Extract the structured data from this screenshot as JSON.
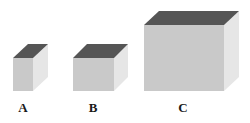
{
  "figure": {
    "colors": {
      "front": "#c9c9c9",
      "side": "#e6e6e6",
      "top": "#555555"
    },
    "cubes": [
      {
        "label": "A",
        "front": {
          "x": 13,
          "y": 58,
          "w": 20,
          "h": 33
        },
        "depth_dx": 15,
        "depth_dy": 14,
        "label_x": 23
      },
      {
        "label": "B",
        "front": {
          "x": 73,
          "y": 58,
          "w": 41,
          "h": 33
        },
        "depth_dx": 14,
        "depth_dy": 14,
        "label_x": 93
      },
      {
        "label": "C",
        "front": {
          "x": 144,
          "y": 25,
          "w": 80,
          "h": 66
        },
        "depth_dx": 15,
        "depth_dy": 14,
        "label_x": 183
      }
    ]
  }
}
